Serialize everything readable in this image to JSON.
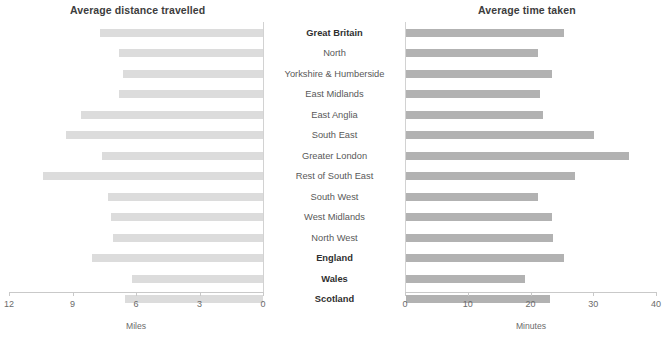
{
  "left_panel": {
    "title": "Average distance travelled",
    "axis_label": "Miles",
    "ticks": [
      "12",
      "9",
      "6",
      "3",
      "0"
    ]
  },
  "right_panel": {
    "title": "Average time taken",
    "axis_label": "Minutes",
    "ticks": [
      "0",
      "10",
      "20",
      "30",
      "40"
    ]
  },
  "categories": [
    {
      "label": "Great Britain",
      "bold": true
    },
    {
      "label": "North",
      "bold": false
    },
    {
      "label": "Yorkshire & Humberside",
      "bold": false
    },
    {
      "label": "East Midlands",
      "bold": false
    },
    {
      "label": "East Anglia",
      "bold": false
    },
    {
      "label": "South East",
      "bold": false
    },
    {
      "label": "Greater London",
      "bold": false
    },
    {
      "label": "Rest of South East",
      "bold": false
    },
    {
      "label": "South West",
      "bold": false
    },
    {
      "label": "West Midlands",
      "bold": false
    },
    {
      "label": "North West",
      "bold": false
    },
    {
      "label": "England",
      "bold": true
    },
    {
      "label": "Wales",
      "bold": true
    },
    {
      "label": "Scotland",
      "bold": true
    }
  ],
  "colors": {
    "bar_distance": "#dcdcdc",
    "bar_time": "#b2b2b2",
    "axis": "#c9c9c9",
    "label_text": "#595959",
    "title_text": "#3d3d3d"
  },
  "chart_data": [
    {
      "type": "bar",
      "title": "Average distance travelled",
      "orientation": "horizontal",
      "direction": "right-to-left",
      "xlabel": "Miles",
      "ylabel": "",
      "xlim": [
        12,
        0
      ],
      "xticks": [
        12,
        9,
        6,
        3,
        0
      ],
      "grid": false,
      "legend": "none",
      "categories": [
        "Great Britain",
        "North",
        "Yorkshire & Humberside",
        "East Midlands",
        "East Anglia",
        "South East",
        "Greater London",
        "Rest of South East",
        "South West",
        "West Midlands",
        "North West",
        "England",
        "Wales",
        "Scotland"
      ],
      "values": [
        7.7,
        6.8,
        6.6,
        6.8,
        8.6,
        9.3,
        7.6,
        10.4,
        7.3,
        7.2,
        7.1,
        8.1,
        6.2,
        6.5
      ]
    },
    {
      "type": "bar",
      "title": "Average time taken",
      "orientation": "horizontal",
      "direction": "left-to-right",
      "xlabel": "Minutes",
      "ylabel": "",
      "xlim": [
        0,
        40
      ],
      "xticks": [
        0,
        10,
        20,
        30,
        40
      ],
      "grid": false,
      "legend": "none",
      "categories": [
        "Great Britain",
        "North",
        "Yorkshire & Humberside",
        "East Midlands",
        "East Anglia",
        "South East",
        "Greater London",
        "Rest of South East",
        "South West",
        "West Midlands",
        "North West",
        "England",
        "Wales",
        "Scotland"
      ],
      "values": [
        25.1,
        21.1,
        23.2,
        21.3,
        21.9,
        29.9,
        35.5,
        27.0,
        21.1,
        23.2,
        23.4,
        25.1,
        19.0,
        22.9
      ]
    }
  ]
}
